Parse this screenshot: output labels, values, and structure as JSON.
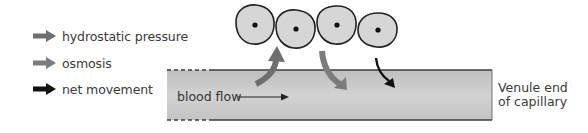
{
  "legend": {
    "items": [
      {
        "label": "hydrostatic pressure",
        "arrow_color": "#6e6e6e",
        "icon": "gray-arrow-icon"
      },
      {
        "label": "osmosis",
        "arrow_color": "#7c7c7c",
        "icon": "gray-arrow-icon"
      },
      {
        "label": "net movement",
        "arrow_color": "#111111",
        "icon": "black-arrow-icon"
      }
    ]
  },
  "capillary": {
    "flow_label": "blood flow",
    "end_label_line1": "Venule end",
    "end_label_line2": "of capillary",
    "fill_color": "#c9c9c9",
    "edge_color": "#444444"
  },
  "cells": {
    "count": 4,
    "fill_color": "#d6d6d6",
    "outline_color": "#222222"
  },
  "colors": {
    "hydrostatic_pressure": "#6e6e6e",
    "osmosis": "#7c7c7c",
    "net_movement": "#111111"
  }
}
